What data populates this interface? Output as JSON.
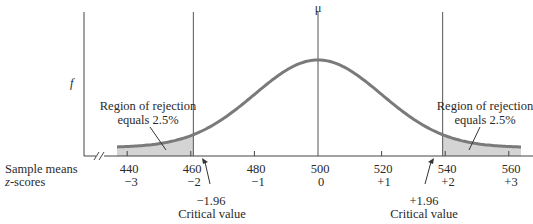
{
  "chart_data": {
    "type": "area",
    "title": "",
    "ylabel": "f",
    "xlabel_rows": [
      "Sample means",
      "z-scores"
    ],
    "mean_label": "μ",
    "mean": 500,
    "sd": 20,
    "x": [
      440,
      460,
      480,
      500,
      520,
      540,
      560
    ],
    "tick_labels": [
      "440",
      "460",
      "480",
      "500",
      "520",
      "540",
      "560"
    ],
    "z_tick_labels": [
      "−3",
      "−2",
      "−1",
      "0",
      "+1",
      "+2",
      "+3"
    ],
    "z_values": [
      -3,
      -2,
      -1,
      0,
      1,
      2,
      3
    ],
    "critical_values": [
      {
        "z": -1.96,
        "label": "−1.96",
        "caption": "Critical value"
      },
      {
        "z": 1.96,
        "label": "+1.96",
        "caption": "Critical value"
      }
    ],
    "rejection_regions": [
      {
        "side": "left",
        "label_line1": "Region of rejection",
        "label_line2": "equals 2.5%",
        "area_percent": 2.5
      },
      {
        "side": "right",
        "label_line1": "Region of rejection",
        "label_line2": "equals 2.5%",
        "area_percent": 2.5
      }
    ],
    "axis_break": true,
    "grid": false,
    "legend": null,
    "colors": {
      "curve": "#7a7a7a",
      "shade": "#d4d4d4",
      "axis": "#444444",
      "text": "#2a2a2a"
    }
  },
  "labels": {
    "y_axis": "f",
    "mu": "μ",
    "row1": "Sample means",
    "row2": "z-scores",
    "left_region_1": "Region of rejection",
    "left_region_2": "equals 2.5%",
    "right_region_1": "Region of rejection",
    "right_region_2": "equals 2.5%",
    "left_crit_value": "−1.96",
    "left_crit_caption": "Critical value",
    "right_crit_value": "+1.96",
    "right_crit_caption": "Critical value",
    "ticks": [
      "440",
      "460",
      "480",
      "500",
      "520",
      "540",
      "560"
    ],
    "zticks": [
      "−3",
      "−2",
      "−1",
      "0",
      "+1",
      "+2",
      "+3"
    ]
  }
}
